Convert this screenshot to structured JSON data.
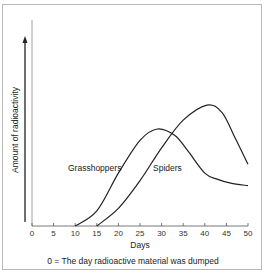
{
  "chart_data": {
    "type": "line",
    "title": "",
    "xlabel": "Days",
    "ylabel": "Amount of radioactivity",
    "xlim": [
      0,
      50
    ],
    "ylim": [
      0,
      100
    ],
    "x_ticks": [
      0,
      5,
      10,
      15,
      20,
      25,
      30,
      35,
      40,
      45,
      50
    ],
    "y_ticks": [],
    "grid": false,
    "legend": "inline labels",
    "annotation": "0 = The day radioactive material was dumped",
    "series": [
      {
        "name": "Grasshoppers",
        "label_text": "Grasshoppers",
        "points": [
          [
            10,
            0
          ],
          [
            15,
            12
          ],
          [
            20,
            42
          ],
          [
            25,
            68
          ],
          [
            29,
            77
          ],
          [
            33,
            72
          ],
          [
            36,
            60
          ],
          [
            40,
            42
          ],
          [
            43,
            37
          ],
          [
            46,
            34
          ],
          [
            50,
            32
          ]
        ]
      },
      {
        "name": "Spiders",
        "label_text": "Spiders",
        "points": [
          [
            15,
            0
          ],
          [
            20,
            14
          ],
          [
            25,
            36
          ],
          [
            30,
            62
          ],
          [
            35,
            84
          ],
          [
            40.5,
            96
          ],
          [
            44,
            90
          ],
          [
            47,
            70
          ],
          [
            50,
            49
          ]
        ]
      }
    ]
  }
}
